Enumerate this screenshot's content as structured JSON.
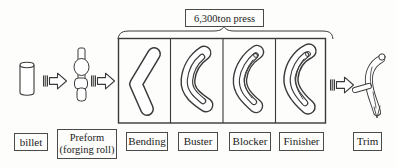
{
  "diagram": {
    "press_label": "6,300ton press",
    "stage_labels": {
      "billet": "billet",
      "preform_line1": "Preform",
      "preform_line2": "(forging roll)",
      "bending": "Bending",
      "buster": "Buster",
      "blocker": "Blocker",
      "finisher": "Finisher",
      "trim": "Trim"
    },
    "icons": {
      "flow_arrow": "right-block-arrow-with-hatched-tail",
      "brace": "horizontal-overbrace"
    },
    "colors": {
      "line": "#3a3a3a",
      "background": "#fdfdfb",
      "text": "#1c1c1c"
    }
  }
}
